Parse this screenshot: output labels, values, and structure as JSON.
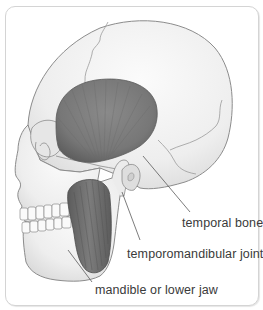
{
  "diagram": {
    "colors": {
      "bone": "#efefef",
      "bone_outline": "#8c8c8c",
      "muscle": "#7a7a7a",
      "muscle_dark": "#5a5a5a",
      "frame_border": "#d4d4d4",
      "label_text": "#3a3a3a",
      "leader_line": "#5a5a5a"
    },
    "labels": [
      {
        "id": "temporal-bone",
        "text": "temporal bone"
      },
      {
        "id": "temporomandibular-joint",
        "text": "temporomandibular joint"
      },
      {
        "id": "mandible",
        "text": "mandible or lower jaw"
      }
    ]
  }
}
